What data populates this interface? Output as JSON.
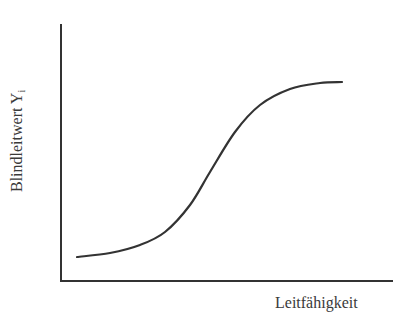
{
  "chart_data": {
    "type": "line",
    "title": "",
    "xlabel": "Leitfähigkeit",
    "ylabel": "Blindleitwert Y",
    "ylabel_subscript": "i",
    "grid": false,
    "legend": null,
    "ticks": {
      "x": [],
      "y": []
    },
    "series": [
      {
        "name": "Blindleitwert",
        "x": [
          0.05,
          0.15,
          0.24,
          0.32,
          0.39,
          0.45,
          0.53,
          0.6,
          0.69,
          0.78,
          0.85
        ],
        "y": [
          0.1,
          0.12,
          0.15,
          0.2,
          0.3,
          0.43,
          0.58,
          0.69,
          0.75,
          0.77,
          0.77
        ]
      }
    ],
    "pixel_path": [
      [
        77,
        257
      ],
      [
        110,
        253
      ],
      [
        140,
        245
      ],
      [
        165,
        232
      ],
      [
        190,
        205
      ],
      [
        210,
        172
      ],
      [
        235,
        132
      ],
      [
        260,
        105
      ],
      [
        290,
        89
      ],
      [
        320,
        83
      ],
      [
        342,
        82
      ]
    ],
    "colors": {
      "axis": "#333333",
      "curve": "#333333",
      "background": "#ffffff"
    }
  }
}
